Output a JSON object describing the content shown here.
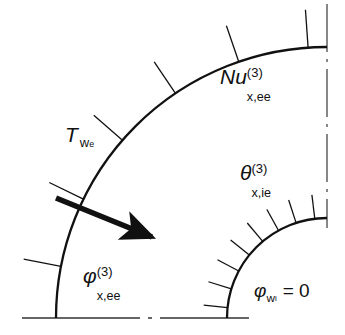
{
  "figure": {
    "name": "quarter-annulus-heat-transfer-diagram",
    "width": 345,
    "height": 335,
    "background_color": "#ffffff",
    "line_color": "#111111",
    "centerline_color": "#555555"
  },
  "geometry": {
    "center_x": 327,
    "center_y": 318,
    "outer_radius": 271,
    "inner_radius": 100,
    "outer_arc_stroke": 2.2,
    "inner_arc_stroke": 2.2,
    "outer_tick_count": 6,
    "outer_tick_angles_deg": [
      11,
      26,
      41,
      56,
      71,
      86
    ],
    "outer_tick_length": 38,
    "inner_tick_count": 8,
    "inner_tick_angles_deg": [
      6,
      17,
      28,
      39,
      50,
      61,
      72,
      83
    ],
    "inner_tick_length": 24,
    "arrow": {
      "start_x": 56,
      "start_y": 198,
      "end_x": 157,
      "end_y": 239,
      "stroke": 5.5
    },
    "vertical_centerline": {
      "x": 327,
      "y_top": 4,
      "y_bottom": 228
    },
    "horizontal_centerline": {
      "y": 318,
      "x_left": 22,
      "x_right": 249
    }
  },
  "labels": {
    "nusselt": {
      "base": "Nu",
      "superscript": "(3)",
      "subscript": "x,ee"
    },
    "theta": {
      "base": "θ",
      "superscript": "(3)",
      "subscript": "x,ie"
    },
    "phi_outer": {
      "base": "φ",
      "superscript": "(3)",
      "subscript": "x,ee"
    },
    "phi_wall": {
      "base": "φ",
      "subscript": "w",
      "sub_subscript": "i",
      "equals": "= 0"
    },
    "wall_temperature": {
      "base": "T",
      "subscript": "w",
      "sub_subscript": "e"
    }
  }
}
